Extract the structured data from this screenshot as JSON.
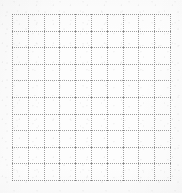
{
  "document": {
    "kind": "scanned-grid-paper",
    "title": "Dotted grid sheet",
    "description": "A plain scanned sheet of dotted graph paper. No text, labels, headings or controls are present.",
    "width_px": 182,
    "height_px": 193
  },
  "canvas": {
    "background_color": "#fdfdfd",
    "page_color": "#ffffff"
  },
  "grid": {
    "name": "dotted-grid",
    "origin_x_px": 12,
    "origin_y_px": 14,
    "width_px": 158,
    "height_px": 166,
    "columns": 10,
    "rows": 10,
    "cell_width_px": 15.8,
    "cell_height_px": 16.6,
    "line_style": "dotted",
    "dot_pitch_px": 2,
    "dot_size_px": 1,
    "line_color": "#a2a2a2",
    "node_color": "#7d7d7d",
    "vertical_line_count": 11,
    "horizontal_line_count": 11
  },
  "texture": {
    "noise_color": "#aaaaaa",
    "noise_opacity": 0.55,
    "vignette": true
  },
  "content": {
    "text_present": false,
    "labels": [],
    "annotations": []
  }
}
